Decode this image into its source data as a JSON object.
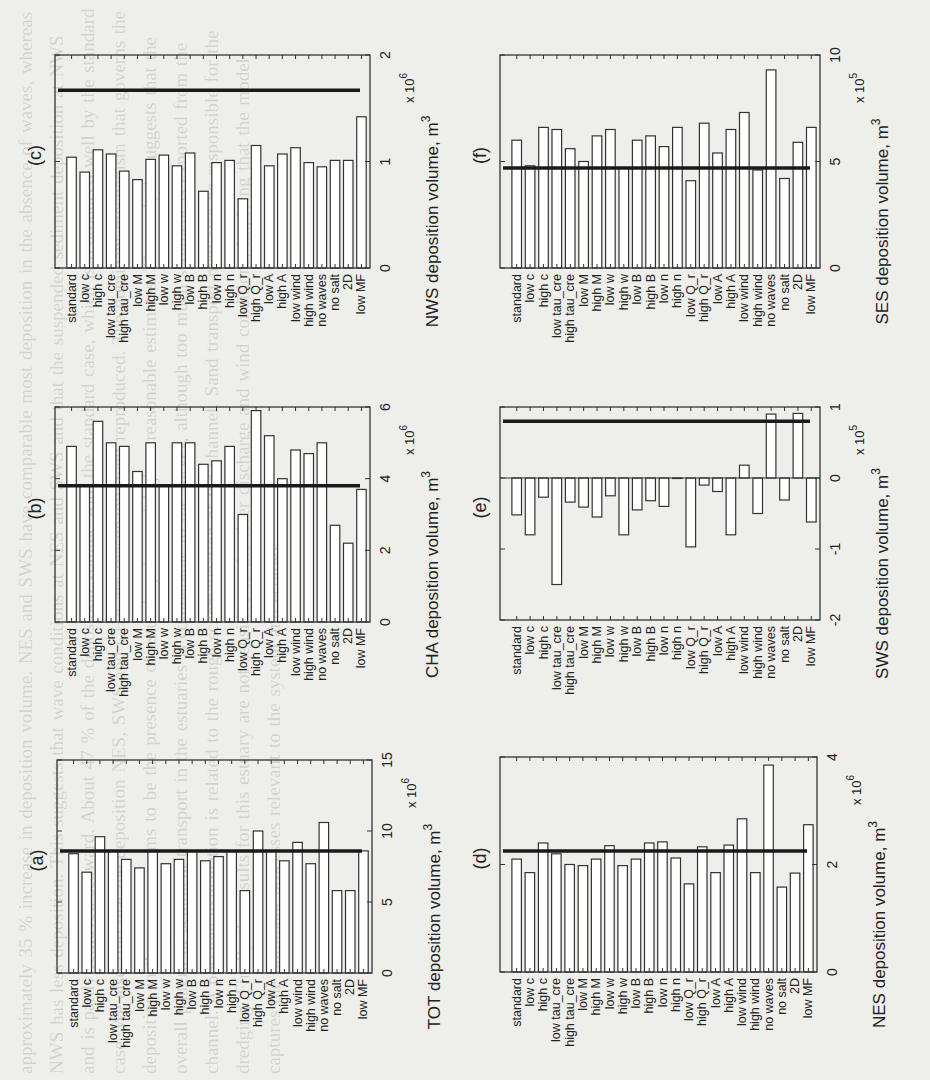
{
  "figure": {
    "background_text": "approximately 35 % increase in deposition volume. NES and SWS have comparable most deposition in the absence of waves, whereas NWS has less deposition. This suggests that wave conditions at NES and SWS and that the suspended sediment deposition at NWS and is partly removed seaward. About 47 % of the deposition volume with the standard case, which is reproduced well by the standard case. We also find that the deposition NES, SWS and CHA are reasonably well reproduced. The dominant mechanism that governs the deposition in these areas seems to be the presence of estuaries, the model gives reasonable estimates. The analysis suggests that the overall pattern of sediment transport in the estuaries is comparable to the survey, although too much sediment is exported from the channel. A possible explanation is related to the rough schematization of the channel. Sand transport may also be responsible for the dredging. Finally the results for this estuary are not sensitive to the river discharge and wind conditions, implying that the model captures the dominant processes relevant to the system and ecology."
  },
  "chart_data": [
    {
      "id": "c",
      "type": "bar",
      "panel_label": "(c)",
      "title": "",
      "xlabel": "",
      "ylabel": "NWS deposition volume, m",
      "ylabel_sup": "3",
      "exponent": "x 10",
      "exponent_sup": "6",
      "ylim": [
        0,
        2
      ],
      "yticks": [
        0,
        1,
        2
      ],
      "reference_line": 1.67,
      "categories": [
        "standard",
        "low c",
        "high c",
        "low tau_cre",
        "high tau_cre",
        "low M",
        "high M",
        "low w",
        "high w",
        "low B",
        "high B",
        "low n",
        "high n",
        "low Q_r",
        "high Q_r",
        "low A",
        "high A",
        "low wind",
        "high wind",
        "no waves",
        "no salt",
        "2D",
        "low MF"
      ],
      "values": [
        1.04,
        0.9,
        1.11,
        1.07,
        0.91,
        0.83,
        1.02,
        1.06,
        0.96,
        1.08,
        0.72,
        0.99,
        1.01,
        0.65,
        1.15,
        0.96,
        1.07,
        1.13,
        0.99,
        0.95,
        1.01,
        1.01,
        1.42
      ]
    },
    {
      "id": "b",
      "type": "bar",
      "panel_label": "(b)",
      "title": "",
      "xlabel": "",
      "ylabel": "CHA deposition volume, m",
      "ylabel_sup": "3",
      "exponent": "x 10",
      "exponent_sup": "6",
      "ylim": [
        0,
        6
      ],
      "yticks": [
        0,
        2,
        4,
        6
      ],
      "reference_line": 3.8,
      "categories": [
        "standard",
        "low c",
        "high c",
        "low tau_cre",
        "high tau_cre",
        "low M",
        "high M",
        "low w",
        "high w",
        "low B",
        "high B",
        "low n",
        "high n",
        "low Q_r",
        "high Q_r",
        "low A",
        "high A",
        "low wind",
        "high wind",
        "no waves",
        "no salt",
        "2D",
        "low MF"
      ],
      "values": [
        4.9,
        3.8,
        5.6,
        5.0,
        4.9,
        4.2,
        5.0,
        3.8,
        5.0,
        5.0,
        4.4,
        4.5,
        4.9,
        3.0,
        5.9,
        5.2,
        4.0,
        4.8,
        4.7,
        5.0,
        2.7,
        2.2,
        3.7
      ]
    },
    {
      "id": "a",
      "type": "bar",
      "panel_label": "(a)",
      "title": "",
      "xlabel": "",
      "ylabel": "TOT deposition volume, m",
      "ylabel_sup": "3",
      "exponent": "x 10",
      "exponent_sup": "6",
      "ylim": [
        0,
        15
      ],
      "yticks": [
        0,
        5,
        10,
        15
      ],
      "reference_line": 8.6,
      "categories": [
        "standard",
        "low c",
        "high c",
        "low tau_cre",
        "high tau_cre",
        "low M",
        "high M",
        "low w",
        "high w",
        "low B",
        "high B",
        "low n",
        "high n",
        "low Q_r",
        "high Q_r",
        "low A",
        "high A",
        "low wind",
        "high wind",
        "no waves",
        "no salt",
        "2D",
        "low MF"
      ],
      "values": [
        8.4,
        7.1,
        9.6,
        8.6,
        8.0,
        7.4,
        8.6,
        7.7,
        8.0,
        8.6,
        7.9,
        8.2,
        8.6,
        5.8,
        10.0,
        8.6,
        7.9,
        9.2,
        7.7,
        10.6,
        5.8,
        5.8,
        8.6
      ]
    },
    {
      "id": "f",
      "type": "bar",
      "panel_label": "(f)",
      "title": "",
      "xlabel": "",
      "ylabel": "SES deposition volume, m",
      "ylabel_sup": "3",
      "exponent": "x 10",
      "exponent_sup": "5",
      "ylim": [
        0,
        10
      ],
      "yticks": [
        0,
        5,
        10
      ],
      "reference_line": 4.7,
      "categories": [
        "standard",
        "low c",
        "high c",
        "low tau_cre",
        "high tau_cre",
        "low M",
        "high M",
        "low w",
        "high w",
        "low B",
        "high B",
        "low n",
        "high n",
        "low Q_r",
        "high Q_r",
        "low A",
        "high A",
        "low wind",
        "high wind",
        "no waves",
        "no salt",
        "2D",
        "low MF"
      ],
      "values": [
        6.0,
        4.8,
        6.6,
        6.5,
        5.6,
        5.0,
        6.2,
        6.5,
        4.7,
        6.0,
        6.2,
        5.7,
        6.6,
        4.1,
        6.8,
        5.4,
        6.5,
        7.3,
        4.6,
        9.3,
        4.2,
        5.9,
        6.6
      ]
    },
    {
      "id": "e",
      "type": "bar",
      "panel_label": "(e)",
      "title": "",
      "xlabel": "",
      "ylabel": "SWS deposition volume, m",
      "ylabel_sup": "3",
      "exponent": "x 10",
      "exponent_sup": "5",
      "ylim": [
        -2,
        1
      ],
      "yticks": [
        -2,
        -1,
        0,
        1
      ],
      "reference_line": 0.8,
      "categories": [
        "standard",
        "low c",
        "high c",
        "low tau_cre",
        "high tau_cre",
        "low M",
        "high M",
        "low w",
        "high w",
        "low B",
        "high B",
        "low n",
        "high n",
        "low Q_r",
        "high Q_r",
        "low A",
        "high A",
        "low wind",
        "high wind",
        "no waves",
        "no salt",
        "2D",
        "low MF"
      ],
      "values": [
        -0.52,
        -0.8,
        -0.27,
        -1.5,
        -0.34,
        -0.41,
        -0.55,
        -0.25,
        -0.8,
        -0.45,
        -0.32,
        -0.4,
        0.0,
        -0.97,
        -0.1,
        -0.19,
        -0.8,
        0.18,
        -0.5,
        0.9,
        -0.31,
        0.91,
        -0.62
      ]
    },
    {
      "id": "d",
      "type": "bar",
      "panel_label": "(d)",
      "title": "",
      "xlabel": "",
      "ylabel": "NES deposition volume, m",
      "ylabel_sup": "3",
      "exponent": "x 10",
      "exponent_sup": "6",
      "ylim": [
        0,
        4
      ],
      "yticks": [
        0,
        2,
        4
      ],
      "reference_line": 2.25,
      "categories": [
        "standard",
        "low c",
        "high c",
        "low tau_cre",
        "high tau_cre",
        "low M",
        "high M",
        "low w",
        "high w",
        "low B",
        "high B",
        "low n",
        "high n",
        "low Q_r",
        "high Q_r",
        "low A",
        "high A",
        "low wind",
        "high wind",
        "no waves",
        "no salt",
        "2D",
        "low MF"
      ],
      "values": [
        2.1,
        1.85,
        2.4,
        2.2,
        2.0,
        1.98,
        2.1,
        2.35,
        1.98,
        2.1,
        2.4,
        2.42,
        2.12,
        1.64,
        2.33,
        1.85,
        2.36,
        2.85,
        1.85,
        3.85,
        1.58,
        1.84,
        2.74
      ]
    }
  ],
  "colors": {
    "bar_fill": "#ffffff",
    "bar_stroke": "#333333",
    "reference_line": "#1a1a1a",
    "axis": "#333333",
    "page": "#eeeeea"
  }
}
